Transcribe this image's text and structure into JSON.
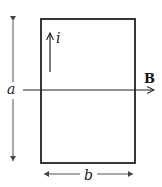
{
  "diagram": {
    "labels": {
      "height": "a",
      "width": "b",
      "current": "i",
      "field": "B"
    },
    "colors": {
      "stroke": "#222222",
      "background": "#ffffff"
    }
  }
}
